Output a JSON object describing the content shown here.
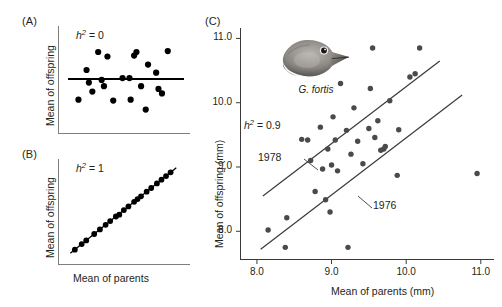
{
  "figure": {
    "panels": [
      {
        "id": "A",
        "label": "(A)",
        "h2_text": "h2 = 0",
        "h2_prefix": "h",
        "h2_sup": "2",
        "h2_value": " = 0",
        "ylabel": "Mean of offspring",
        "xlabel": ""
      },
      {
        "id": "B",
        "label": "(B)",
        "h2_text": "h2 = 1",
        "h2_prefix": "h",
        "h2_sup": "2",
        "h2_value": " = 1",
        "ylabel": "Mean of offspring",
        "xlabel": "Mean of parents"
      },
      {
        "id": "C",
        "label": "(C)",
        "h2_prefix": "h",
        "h2_sup": "2",
        "h2_value": " = 0.9",
        "ylabel": "Mean of offspring (mm)",
        "xlabel": "Mean of parents (mm)",
        "species": "G. fortis",
        "series_labels": [
          "1978",
          "1976"
        ]
      }
    ]
  },
  "chart_data": [
    {
      "type": "scatter",
      "panel": "A",
      "title": "",
      "xlabel": "Mean of parents",
      "ylabel": "Mean of offspring",
      "annotation": "h² = 0",
      "xlim": [
        0,
        10
      ],
      "ylim": [
        0,
        10
      ],
      "grid": false,
      "axes_ticks": false,
      "regression_line": {
        "slope": 0,
        "intercept": 5.0,
        "label": "h² = 0 fit"
      },
      "points": [
        {
          "x": 0.9,
          "y": 2.7
        },
        {
          "x": 1.6,
          "y": 6.0
        },
        {
          "x": 1.8,
          "y": 4.6
        },
        {
          "x": 2.1,
          "y": 3.6
        },
        {
          "x": 2.6,
          "y": 8.0
        },
        {
          "x": 2.9,
          "y": 4.9
        },
        {
          "x": 3.1,
          "y": 4.2
        },
        {
          "x": 3.4,
          "y": 7.5
        },
        {
          "x": 3.9,
          "y": 2.6
        },
        {
          "x": 4.7,
          "y": 5.1
        },
        {
          "x": 5.3,
          "y": 5.1
        },
        {
          "x": 5.4,
          "y": 2.7
        },
        {
          "x": 5.7,
          "y": 7.6
        },
        {
          "x": 5.9,
          "y": 8.0
        },
        {
          "x": 6.3,
          "y": 4.2
        },
        {
          "x": 6.7,
          "y": 1.6
        },
        {
          "x": 6.9,
          "y": 6.6
        },
        {
          "x": 7.6,
          "y": 5.7
        },
        {
          "x": 7.8,
          "y": 3.9
        },
        {
          "x": 8.1,
          "y": 3.4
        },
        {
          "x": 8.6,
          "y": 8.1
        }
      ]
    },
    {
      "type": "scatter",
      "panel": "B",
      "title": "",
      "xlabel": "Mean of parents",
      "ylabel": "Mean of offspring",
      "annotation": "h² = 1",
      "xlim": [
        0,
        10
      ],
      "ylim": [
        0,
        10
      ],
      "grid": false,
      "axes_ticks": false,
      "regression_line": {
        "slope": 1.0,
        "intercept": 0.2,
        "label": "h² = 1 fit"
      },
      "points": [
        {
          "x": 0.6,
          "y": 0.8
        },
        {
          "x": 1.2,
          "y": 1.4
        },
        {
          "x": 1.6,
          "y": 1.8
        },
        {
          "x": 2.3,
          "y": 2.5
        },
        {
          "x": 2.8,
          "y": 3.0
        },
        {
          "x": 3.3,
          "y": 3.5
        },
        {
          "x": 3.7,
          "y": 3.9
        },
        {
          "x": 4.2,
          "y": 4.4
        },
        {
          "x": 4.5,
          "y": 4.6
        },
        {
          "x": 4.9,
          "y": 5.1
        },
        {
          "x": 5.3,
          "y": 5.5
        },
        {
          "x": 5.8,
          "y": 6.0
        },
        {
          "x": 6.1,
          "y": 6.3
        },
        {
          "x": 6.4,
          "y": 6.6
        },
        {
          "x": 6.9,
          "y": 7.1
        },
        {
          "x": 7.3,
          "y": 7.5
        },
        {
          "x": 7.8,
          "y": 8.0
        },
        {
          "x": 8.2,
          "y": 8.4
        },
        {
          "x": 8.6,
          "y": 8.8
        },
        {
          "x": 9.0,
          "y": 9.2
        }
      ]
    },
    {
      "type": "scatter",
      "panel": "C",
      "title": "",
      "xlabel": "Mean of parents (mm)",
      "ylabel": "Mean of offspring (mm)",
      "annotation": "h² = 0.9",
      "species_label": "G. fortis",
      "xlim": [
        7.8,
        11.15
      ],
      "ylim": [
        7.6,
        11.1
      ],
      "xticks": [
        "8.0",
        "9.0",
        "10.0",
        "11.0"
      ],
      "xtick_values": [
        8.0,
        9.0,
        10.0,
        11.0
      ],
      "yticks": [
        "8.0",
        "9.0",
        "10.0",
        "11.0"
      ],
      "ytick_values": [
        8.0,
        9.0,
        10.0,
        11.0
      ],
      "grid": false,
      "series": [
        {
          "name": "1978",
          "line": {
            "x1": 8.08,
            "y1": 8.55,
            "x2": 10.45,
            "y2": 10.65
          }
        },
        {
          "name": "1976",
          "line": {
            "x1": 8.05,
            "y1": 7.72,
            "x2": 10.75,
            "y2": 10.12
          }
        }
      ],
      "points": [
        {
          "x": 8.15,
          "y": 8.02
        },
        {
          "x": 8.38,
          "y": 7.75
        },
        {
          "x": 8.4,
          "y": 8.21
        },
        {
          "x": 8.6,
          "y": 9.43
        },
        {
          "x": 8.68,
          "y": 9.42
        },
        {
          "x": 8.72,
          "y": 9.1
        },
        {
          "x": 8.78,
          "y": 8.62
        },
        {
          "x": 8.85,
          "y": 9.62
        },
        {
          "x": 8.88,
          "y": 8.97
        },
        {
          "x": 8.92,
          "y": 8.49
        },
        {
          "x": 8.95,
          "y": 9.28
        },
        {
          "x": 8.98,
          "y": 8.3
        },
        {
          "x": 9.0,
          "y": 9.03
        },
        {
          "x": 9.02,
          "y": 9.78
        },
        {
          "x": 9.05,
          "y": 9.42
        },
        {
          "x": 9.08,
          "y": 8.94
        },
        {
          "x": 9.12,
          "y": 10.3
        },
        {
          "x": 9.2,
          "y": 9.57
        },
        {
          "x": 9.22,
          "y": 7.75
        },
        {
          "x": 9.26,
          "y": 9.2
        },
        {
          "x": 9.3,
          "y": 9.92
        },
        {
          "x": 9.35,
          "y": 9.4
        },
        {
          "x": 9.42,
          "y": 9.05
        },
        {
          "x": 9.5,
          "y": 9.6
        },
        {
          "x": 9.52,
          "y": 10.22
        },
        {
          "x": 9.55,
          "y": 10.85
        },
        {
          "x": 9.58,
          "y": 9.46
        },
        {
          "x": 9.62,
          "y": 9.72
        },
        {
          "x": 9.66,
          "y": 9.26
        },
        {
          "x": 9.7,
          "y": 9.28
        },
        {
          "x": 9.72,
          "y": 9.32
        },
        {
          "x": 9.78,
          "y": 10.03
        },
        {
          "x": 9.88,
          "y": 8.87
        },
        {
          "x": 9.9,
          "y": 9.58
        },
        {
          "x": 10.05,
          "y": 10.4
        },
        {
          "x": 10.12,
          "y": 10.45
        },
        {
          "x": 10.18,
          "y": 10.85
        },
        {
          "x": 10.95,
          "y": 8.9
        }
      ]
    }
  ]
}
